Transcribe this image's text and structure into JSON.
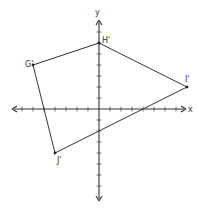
{
  "diagram": {
    "type": "coordinate-plane-quadrilateral",
    "axes": {
      "x_label": "x",
      "y_label": "y",
      "x_range": [
        -8,
        8
      ],
      "y_range": [
        -8,
        8
      ],
      "tick_step": 1
    },
    "vertices": [
      {
        "label": "G'",
        "x": -6,
        "y": 4
      },
      {
        "label": "H'",
        "x": 0,
        "y": 6
      },
      {
        "label": "I'",
        "x": 8,
        "y": 2
      },
      {
        "label": "J'",
        "x": -4,
        "y": -4
      }
    ],
    "colors": {
      "line": "#333333",
      "background": "#ffffff"
    }
  }
}
